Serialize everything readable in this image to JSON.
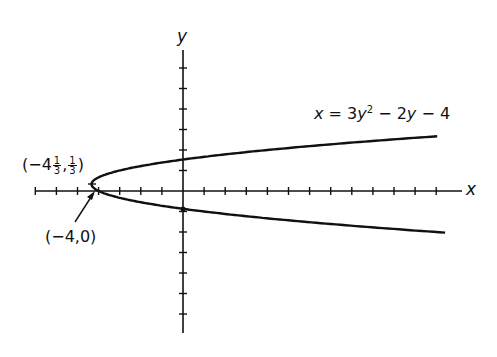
{
  "diagram": {
    "type": "parabola-graph",
    "equation": {
      "text": "x = 3y² − 2y − 4",
      "parts": {
        "lhs": "x",
        "eq": " = 3",
        "y1": "y",
        "exp": "2",
        "mid": " − 2",
        "y2": "y",
        "tail": " − 4"
      }
    },
    "axes": {
      "x_label": "x",
      "y_label": "y",
      "x_ticks": [
        -7,
        -6,
        -5,
        -4,
        -3,
        -2,
        -1,
        1,
        2,
        3,
        4,
        5,
        6,
        7,
        8,
        9,
        10,
        11,
        12
      ],
      "y_ticks": [
        -6,
        -5,
        -4,
        -3,
        -2,
        -1,
        1,
        2,
        3,
        4,
        5,
        6
      ]
    },
    "points": [
      {
        "name": "vertex",
        "label": "(−4⅓, ⅓)",
        "whole": "(−4",
        "frac_num": "1",
        "frac_den": "3",
        "sep": ",",
        "frac2_num": "1",
        "frac2_den": "3",
        "close": ")",
        "x": -4.333,
        "y": 0.333
      },
      {
        "name": "x-intercept",
        "label": "(−4,0)",
        "x": -4,
        "y": 0
      }
    ],
    "colors": {
      "ink": "#111111",
      "background": "#ffffff"
    }
  }
}
